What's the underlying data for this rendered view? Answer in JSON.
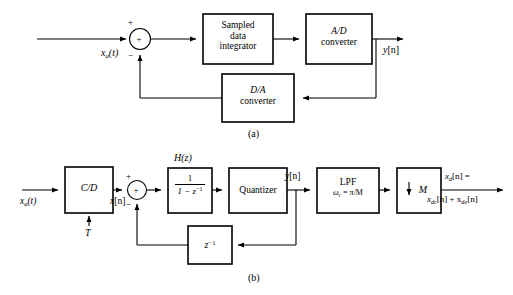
{
  "figure": {
    "background_color": "#ffffff",
    "line_color": "#000000"
  },
  "diagram_a": {
    "caption": "(a)",
    "input_label": "x",
    "input_sub": "a",
    "input_tail": "(t)",
    "summer": {
      "operator": "+",
      "plus_sign": "+",
      "minus_sign": "−"
    },
    "blocks": [
      {
        "name": "sampled-data-integrator",
        "line1": "Sampled",
        "line2": "data",
        "line3": "integrator",
        "italic": false
      },
      {
        "name": "ad-converter",
        "line1": "A/D",
        "line2": "converter",
        "italic": true
      },
      {
        "name": "da-converter",
        "line1": "D/A",
        "line2": "converter",
        "italic": true
      }
    ],
    "output_label": "y",
    "output_bracket": "[n]"
  },
  "diagram_b": {
    "caption": "(b)",
    "input_label": "x",
    "input_sub": "a",
    "input_tail": "(t)",
    "clock_label": "T",
    "cd_block": "C/D",
    "after_cd_label": "x",
    "after_cd_bracket": "[n]",
    "summer": {
      "operator": "+",
      "plus_sign": "+",
      "minus_sign": "−"
    },
    "hz_label": "H(z)",
    "hz_numerator": "1",
    "hz_denominator_a": "1 − z",
    "hz_denominator_sup": "−1",
    "quantizer_label": "Quantizer",
    "quantizer_output": "y",
    "quantizer_output_bracket": "[n]",
    "lpf_line1": "LPF",
    "lpf_omega": "ω",
    "lpf_omega_sub": "c",
    "lpf_cutoff": " = π/M",
    "downsampler_arrow": "↓",
    "downsampler_label": "M",
    "delay_block": "z",
    "delay_block_sup": "−1",
    "output_line1_a": "x",
    "output_line1_sub": "d",
    "output_line1_b": "[n] =",
    "output_line2_a": "x",
    "output_line2_sub_a": "dc",
    "output_line2_b": "[n] + x",
    "output_line2_sub_b": "de",
    "output_line2_c": "[n]"
  }
}
